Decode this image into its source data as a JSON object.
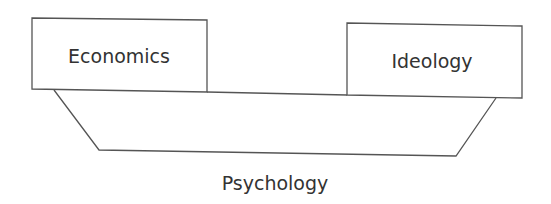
{
  "diagram": {
    "nodes": [
      {
        "id": "economics",
        "label": "Economics"
      },
      {
        "id": "ideology",
        "label": "Ideology"
      }
    ],
    "base": {
      "id": "psychology",
      "label": "Psychology"
    },
    "colors": {
      "stroke": "#555555",
      "text": "#333333",
      "background": "#ffffff"
    }
  }
}
